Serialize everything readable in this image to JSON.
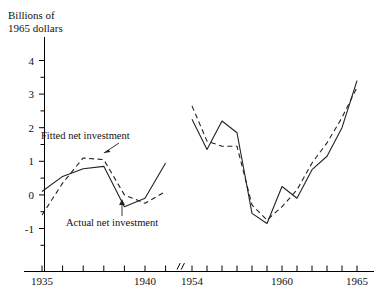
{
  "chart_data": {
    "type": "line",
    "title": "",
    "subtitle": "",
    "ylabel_line1": "Billions of",
    "ylabel_line2": "1965 dollars",
    "xlabel": "",
    "ylim": [
      -1.5,
      4.4
    ],
    "y_major_ticks": [
      4,
      3,
      2,
      1,
      0,
      -1
    ],
    "y_major_tick_labels": [
      "4",
      "3",
      "2",
      "1",
      "0",
      "-1"
    ],
    "y_minor_ticks": [
      3.5,
      2.5,
      1.5,
      0.5,
      -0.5
    ],
    "grid": false,
    "legend_position": "inline-annotations",
    "axis_break": true,
    "axis_break_note": "x-axis broken between 1941 and 1954",
    "x_labeled_ticks": [
      "1935",
      "1940",
      "1954",
      "1960",
      "1965"
    ],
    "panels": [
      {
        "name": "left-panel",
        "x_range": [
          1935,
          1941
        ],
        "x_ticks": [
          1935,
          1936,
          1937,
          1938,
          1939,
          1940,
          1941
        ],
        "labeled": [
          "1935",
          "1940"
        ]
      },
      {
        "name": "right-panel",
        "x_range": [
          1954,
          1965
        ],
        "x_ticks": [
          1954,
          1955,
          1956,
          1957,
          1958,
          1959,
          1960,
          1961,
          1962,
          1963,
          1964,
          1965
        ],
        "labeled": [
          "1954",
          "1960",
          "1965"
        ]
      }
    ],
    "series": [
      {
        "name": "Actual net investment",
        "style": "solid",
        "color": "#222222",
        "segments": [
          {
            "panel": "left-panel",
            "x": [
              1935,
              1936,
              1937,
              1938,
              1939,
              1940,
              1941
            ],
            "values": [
              0.1,
              0.55,
              0.78,
              0.85,
              -0.35,
              -0.1,
              0.95
            ]
          },
          {
            "panel": "right-panel",
            "x": [
              1954,
              1955,
              1956,
              1957,
              1958,
              1959,
              1960,
              1961,
              1962,
              1963,
              1964,
              1965
            ],
            "values": [
              2.25,
              1.35,
              2.2,
              1.85,
              -0.55,
              -0.85,
              0.25,
              -0.1,
              0.75,
              1.15,
              2.0,
              3.4
            ]
          }
        ]
      },
      {
        "name": "Fitted net investment",
        "style": "dashed",
        "color": "#222222",
        "segments": [
          {
            "panel": "left-panel",
            "x": [
              1935,
              1936,
              1937,
              1938,
              1939,
              1940,
              1941
            ],
            "values": [
              -0.6,
              0.35,
              1.1,
              1.05,
              0.0,
              -0.25,
              0.1
            ]
          },
          {
            "panel": "right-panel",
            "x": [
              1954,
              1955,
              1956,
              1957,
              1958,
              1959,
              1960,
              1961,
              1962,
              1963,
              1964,
              1965
            ],
            "values": [
              2.65,
              1.6,
              1.45,
              1.45,
              -0.3,
              -0.75,
              -0.35,
              0.15,
              0.95,
              1.55,
              2.3,
              3.2
            ]
          }
        ]
      }
    ],
    "annotations": [
      {
        "name": "fitted-net-investment-label",
        "text": "Fitted net investment",
        "points_to_series": "Fitted net investment"
      },
      {
        "name": "actual-net-investment-label",
        "text": "Actual net investment",
        "points_to_series": "Actual net investment"
      }
    ]
  }
}
